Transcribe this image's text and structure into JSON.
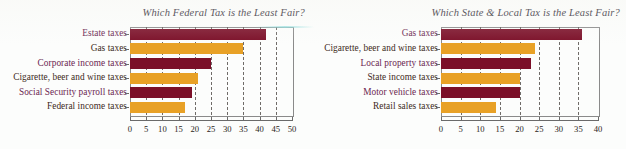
{
  "background_color": "#fcfdfc",
  "palette": {
    "bar_maroon": "#7b0f28",
    "bar_orange": "#e8a126",
    "label_dark": "#6b2550",
    "label_light": "#3c2a22",
    "axis": "#6a6a6a",
    "gridline": "#57524f"
  },
  "charts": [
    {
      "id": "federal-tax-chart",
      "title": "Which Federal Tax is the Least Fair?",
      "type": "bar",
      "orientation": "horizontal",
      "categories": [
        "Estate taxes",
        "Gas taxes",
        "Corporate income taxes",
        "Cigarette, beer and wine taxes",
        "Social Security payroll taxes",
        "Federal income taxes"
      ],
      "values": [
        42,
        35,
        25,
        21,
        19,
        17
      ],
      "colors": [
        "#7b0f28",
        "#e8a126",
        "#7b0f28",
        "#e8a126",
        "#7b0f28",
        "#e8a126"
      ],
      "xlabel": "",
      "ylabel": "",
      "xlim": [
        0,
        50
      ],
      "xticks": [
        0,
        5,
        10,
        15,
        20,
        25,
        30,
        35,
        40,
        45,
        50
      ],
      "xticklabels": [
        "0",
        "5",
        "10",
        "15",
        "20",
        "25",
        "30",
        "35",
        "40",
        "45",
        "50"
      ],
      "grid": true,
      "legend": "none"
    },
    {
      "id": "state-local-tax-chart",
      "title": "Which State & Local Tax is the Least Fair?",
      "type": "bar",
      "orientation": "horizontal",
      "categories": [
        "Gas taxes",
        "Cigarette, beer and wine taxes",
        "Local property taxes",
        "State income taxes",
        "Motor vehicle taxes",
        "Retail sales taxes"
      ],
      "values": [
        36,
        24,
        23,
        20,
        20,
        14
      ],
      "colors": [
        "#7b0f28",
        "#e8a126",
        "#7b0f28",
        "#e8a126",
        "#7b0f28",
        "#e8a126"
      ],
      "xlabel": "",
      "ylabel": "",
      "xlim": [
        0,
        40
      ],
      "xticks": [
        0,
        5,
        10,
        15,
        20,
        25,
        30,
        35,
        40
      ],
      "xticklabels": [
        "0",
        "5",
        "10",
        "15",
        "20",
        "25",
        "30",
        "35",
        "40"
      ],
      "grid": true,
      "legend": "none"
    }
  ],
  "chart_data": [
    {
      "type": "bar",
      "title": "Which Federal Tax is the Least Fair?",
      "categories": [
        "Estate taxes",
        "Gas taxes",
        "Corporate income taxes",
        "Cigarette, beer and wine taxes",
        "Social Security payroll taxes",
        "Federal income taxes"
      ],
      "values": [
        42,
        35,
        25,
        21,
        19,
        17
      ],
      "xlabel": "",
      "ylabel": "",
      "xlim": [
        0,
        50
      ],
      "orientation": "horizontal",
      "grid": true,
      "legend": "none"
    },
    {
      "type": "bar",
      "title": "Which State & Local Tax is the Least Fair?",
      "categories": [
        "Gas taxes",
        "Cigarette, beer and wine taxes",
        "Local property taxes",
        "State income taxes",
        "Motor vehicle taxes",
        "Retail sales taxes"
      ],
      "values": [
        36,
        24,
        23,
        20,
        20,
        14
      ],
      "xlabel": "",
      "ylabel": "",
      "xlim": [
        0,
        40
      ],
      "orientation": "horizontal",
      "grid": true,
      "legend": "none"
    }
  ]
}
